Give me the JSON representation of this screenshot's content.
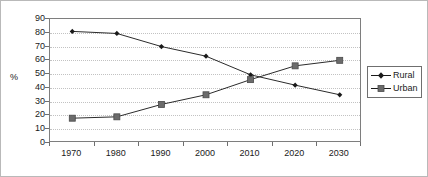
{
  "chart_data": {
    "type": "line",
    "title": "",
    "xlabel": "",
    "ylabel": "%",
    "categories": [
      "1970",
      "1980",
      "1990",
      "2000",
      "2010",
      "2020",
      "2030"
    ],
    "ylim": [
      0,
      90
    ],
    "yticks": [
      0,
      10,
      20,
      30,
      40,
      50,
      60,
      70,
      80,
      90
    ],
    "grid": "horizontal-dotted",
    "legend_position": "right",
    "series": [
      {
        "name": "Rural",
        "values": [
          81,
          79.5,
          70,
          63,
          49.5,
          42,
          35
        ],
        "color": "#1a1a1a",
        "marker": "diamond"
      },
      {
        "name": "Urban",
        "values": [
          18,
          19,
          28,
          35,
          46,
          56,
          60
        ],
        "color": "#6b6b6b",
        "marker": "square"
      }
    ]
  },
  "legend": {
    "items": [
      {
        "label": "Rural"
      },
      {
        "label": "Urban"
      }
    ]
  }
}
